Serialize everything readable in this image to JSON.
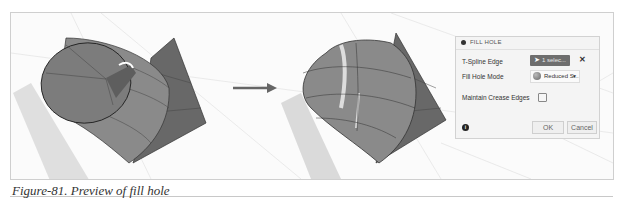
{
  "figure": {
    "caption": "Figure-81. Preview of fill hole",
    "arrow": "right-arrow",
    "left_view": "open T-Spline cylinder with hole",
    "right_view": "filled T-Spline surface preview"
  },
  "dialog": {
    "title": "FILL HOLE",
    "rows": [
      {
        "label": "T-Spline Edge",
        "value": "1 selec...",
        "clear_icon": "✕"
      },
      {
        "label": "Fill Hole Mode",
        "value": "Reduced S...",
        "caret": "▼"
      },
      {
        "label": "Maintain Crease Edges",
        "checked": false
      }
    ],
    "info_icon": "i",
    "ok_label": "OK",
    "cancel_label": "Cancel"
  },
  "colors": {
    "surface": "#6b6b6b",
    "select_button": "#6e6e6e",
    "arrow": "#666666"
  }
}
